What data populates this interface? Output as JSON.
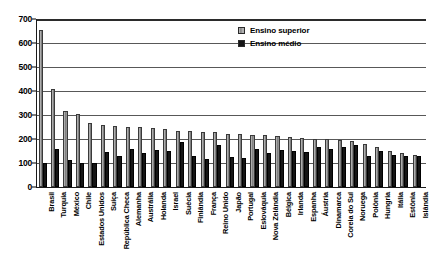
{
  "chart_data": {
    "type": "bar",
    "title": "",
    "xlabel": "",
    "ylabel": "",
    "ylim": [
      0,
      700
    ],
    "ytick_values": [
      700,
      600,
      500,
      400,
      300,
      200,
      100,
      0
    ],
    "ytick_labels": [
      "700",
      "600",
      "500",
      "400",
      "300",
      "200",
      "100",
      "0"
    ],
    "grid": true,
    "grid_axis": "y",
    "legend_position": "top-right",
    "categories": [
      "Brasil",
      "Turquia",
      "México",
      "Chile",
      "Estados Unidos",
      "Suíça",
      "República Checa",
      "Alemanha",
      "Austrália",
      "Holanda",
      "Israel",
      "Suécia",
      "Finlândia",
      "França",
      "Reino Unido",
      "Japão",
      "Portugal",
      "Eslováquia",
      "Nova Zelândia",
      "Bélgica",
      "Irlanda",
      "Espanha",
      "Áustria",
      "Dinamarca",
      "Coreia do Sul",
      "Noruega",
      "Polônia",
      "Hungria",
      "Itália",
      "Estônia",
      "Islândia"
    ],
    "series": [
      {
        "name": "Ensino superior",
        "color": "#8e8e8e",
        "values": [
          655,
          408,
          318,
          305,
          265,
          258,
          255,
          252,
          248,
          245,
          240,
          235,
          232,
          230,
          228,
          222,
          220,
          218,
          215,
          212,
          210,
          205,
          202,
          200,
          196,
          192,
          178,
          165,
          150,
          140,
          132
        ]
      },
      {
        "name": "Ensino médio",
        "color": "#151515",
        "values": [
          98,
          158,
          113,
          100,
          102,
          145,
          128,
          160,
          142,
          155,
          150,
          188,
          130,
          118,
          175,
          125,
          120,
          160,
          140,
          155,
          152,
          145,
          168,
          158,
          165,
          175,
          130,
          148,
          135,
          130,
          128
        ]
      }
    ]
  },
  "legend": {
    "items": [
      {
        "label": "Ensino superior",
        "swatch": "superior"
      },
      {
        "label": "Ensino médio",
        "swatch": "medio"
      }
    ]
  }
}
